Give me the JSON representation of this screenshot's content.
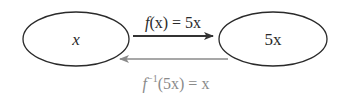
{
  "diagram": {
    "left_node": {
      "label": "x"
    },
    "right_node": {
      "label": "5x"
    },
    "forward_arrow": {
      "label_fn": "f",
      "label_rest": "(x) = 5x",
      "color": "#333333"
    },
    "inverse_arrow": {
      "label_fn": "f",
      "label_sup": "−1",
      "label_rest": "(5x) = x",
      "color": "#8a8a8a"
    },
    "colors": {
      "node_stroke": "#2a2a2a",
      "text": "#2a2a2a",
      "inverse": "#8a8a8a"
    }
  }
}
